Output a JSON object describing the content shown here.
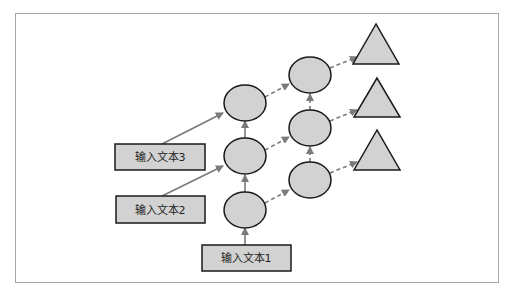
{
  "diagram": {
    "type": "flow-diagram",
    "colors": {
      "node_fill": "#d2d2d2",
      "node_stroke": "#1a1a1a",
      "solid_arrow": "#7a7a7a",
      "dashed_arrow": "#7a7a7a",
      "frame_border": "#a8a8a8"
    },
    "inputs": [
      {
        "id": "input1",
        "label": "输入文本1"
      },
      {
        "id": "input2",
        "label": "输入文本2"
      },
      {
        "id": "input3",
        "label": "输入文本3"
      }
    ],
    "hidden_layer_1": [
      "circle",
      "circle",
      "circle"
    ],
    "hidden_layer_2": [
      "circle",
      "circle",
      "circle"
    ],
    "outputs": [
      "triangle",
      "triangle",
      "triangle"
    ],
    "edges": [
      {
        "from": "input1",
        "to": "L1-bottom",
        "style": "solid"
      },
      {
        "from": "input2",
        "to": "L1-middle",
        "style": "solid"
      },
      {
        "from": "input3",
        "to": "L1-top",
        "style": "solid"
      },
      {
        "from": "L1-bottom",
        "to": "L1-middle",
        "style": "solid"
      },
      {
        "from": "L1-middle",
        "to": "L1-top",
        "style": "solid"
      },
      {
        "from": "L1-top",
        "to": "L2-top",
        "style": "dashed"
      },
      {
        "from": "L1-middle",
        "to": "L2-middle",
        "style": "dashed"
      },
      {
        "from": "L1-bottom",
        "to": "L2-bottom",
        "style": "dashed"
      },
      {
        "from": "L2-bottom",
        "to": "L2-middle",
        "style": "dashed"
      },
      {
        "from": "L2-middle",
        "to": "L2-top",
        "style": "dashed"
      },
      {
        "from": "L2-top",
        "to": "out-top",
        "style": "dashed"
      },
      {
        "from": "L2-middle",
        "to": "out-middle",
        "style": "dashed"
      },
      {
        "from": "L2-bottom",
        "to": "out-bottom",
        "style": "dashed"
      }
    ]
  }
}
